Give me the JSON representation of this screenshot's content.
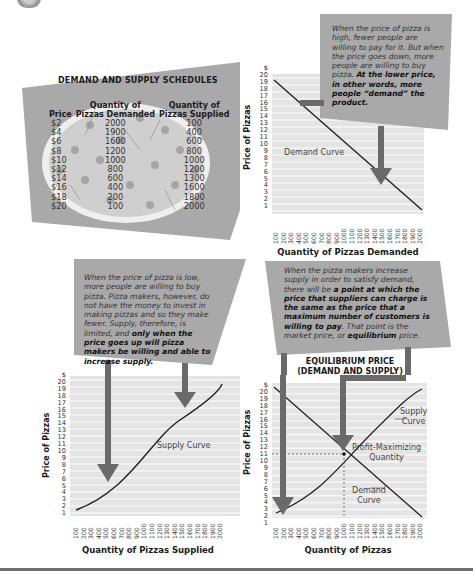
{
  "schedule": {
    "title": "DEMAND AND SUPPLY SCHEDULES",
    "headers": {
      "price": "Price",
      "demanded_line1": "Quantity of",
      "demanded_line2": "Pizzas Demanded",
      "supplied_line1": "Quantity of",
      "supplied_line2": "Pizzas Supplied"
    },
    "rows": [
      {
        "price": "$2",
        "demanded": "2000",
        "supplied": "100"
      },
      {
        "price": "$4",
        "demanded": "1900",
        "supplied": "400"
      },
      {
        "price": "$6",
        "demanded": "1600",
        "supplied": "600"
      },
      {
        "price": "$8",
        "demanded": "1200",
        "supplied": "800"
      },
      {
        "price": "$10",
        "demanded": "1000",
        "supplied": "1000"
      },
      {
        "price": "$12",
        "demanded": "800",
        "supplied": "1200"
      },
      {
        "price": "$14",
        "demanded": "600",
        "supplied": "1300"
      },
      {
        "price": "$16",
        "demanded": "400",
        "supplied": "1600"
      },
      {
        "price": "$18",
        "demanded": "200",
        "supplied": "1800"
      },
      {
        "price": "$20",
        "demanded": "100",
        "supplied": "2000"
      }
    ]
  },
  "callouts": {
    "demand": {
      "italic": "When the price of pizza is high, fewer people are willing to pay for it. But when the price goes down, more people are willing to buy pizza.",
      "bold": "At the lower price, in other words, more people “demand” the product."
    },
    "supply": {
      "italic": "When the price of pizza is low, more people are willing to buy pizza. Pizza makers, however, do not have the money to invest in making pizzas and so they make fewer. Supply, therefore, is limited, and",
      "bold": "only when the price goes up will pizza makers be willing and able to increase supply."
    },
    "equilibrium": {
      "italic1": "When the pizza makers increase supply in order to satisfy demand, there will be",
      "bold1": "a point at which the price that suppliers can charge is the same as the price that a maximum number of customers is willing to pay",
      "italic2": ". That point is the market price, or",
      "bold2": "equilibrium",
      "italic3": "price."
    }
  },
  "axes": {
    "y_unit": "$",
    "y_ticks": [
      "20",
      "19",
      "18",
      "17",
      "16",
      "15",
      "14",
      "13",
      "12",
      "11",
      "10",
      "9",
      "8",
      "7",
      "6",
      "5",
      "4",
      "3",
      "2",
      "1"
    ],
    "x_ticks": [
      "100",
      "200",
      "300",
      "400",
      "500",
      "600",
      "700",
      "800",
      "900",
      "1000",
      "1100",
      "1200",
      "1300",
      "1400",
      "1500",
      "1600",
      "1700",
      "1800",
      "1900",
      "2000"
    ],
    "y_label": "Price of Pizzas"
  },
  "charts": {
    "demand": {
      "curve_label": "Demand Curve",
      "x_label": "Quantity of Pizzas Demanded"
    },
    "supply": {
      "curve_label": "Supply Curve",
      "x_label": "Quantity of Pizzas Supplied"
    },
    "equilibrium": {
      "title_line1": "EQUILIBRIUM PRICE",
      "title_line2": "(DEMAND AND SUPPLY)",
      "supply_label_1": "Supply",
      "supply_label_2": "Curve",
      "point_label_1": "Profit-Maximizing",
      "point_label_2": "Quantity",
      "demand_label_1": "Demand",
      "demand_label_2": "Curve",
      "x_label": "Quantity of Pizzas"
    }
  },
  "colors": {
    "panel_gray": "#a9a9a9",
    "grid_bg": "#e4e4e4",
    "grid_line": "#f4f4f4",
    "arrow": "#6a6a6a",
    "curve": "#222222"
  },
  "chart_data": [
    {
      "type": "table",
      "title": "DEMAND AND SUPPLY SCHEDULES",
      "columns": [
        "Price",
        "Quantity of Pizzas Demanded",
        "Quantity of Pizzas Supplied"
      ],
      "rows": [
        [
          2,
          2000,
          100
        ],
        [
          4,
          1900,
          400
        ],
        [
          6,
          1600,
          600
        ],
        [
          8,
          1200,
          800
        ],
        [
          10,
          1000,
          1000
        ],
        [
          12,
          800,
          1200
        ],
        [
          14,
          600,
          1300
        ],
        [
          16,
          400,
          1600
        ],
        [
          18,
          200,
          1800
        ],
        [
          20,
          100,
          2000
        ]
      ]
    },
    {
      "type": "line",
      "title": "Demand Curve",
      "xlabel": "Quantity of Pizzas Demanded",
      "ylabel": "Price of Pizzas",
      "x": [
        100,
        200,
        400,
        600,
        800,
        1000,
        1200,
        1600,
        1900,
        2000
      ],
      "series": [
        {
          "name": "Demand Curve",
          "values": [
            20,
            18,
            16,
            14,
            12,
            10,
            8,
            6,
            4,
            2
          ]
        }
      ],
      "xlim": [
        100,
        2000
      ],
      "ylim": [
        1,
        20
      ],
      "grid": true
    },
    {
      "type": "line",
      "title": "Supply Curve",
      "xlabel": "Quantity of Pizzas Supplied",
      "ylabel": "Price of Pizzas",
      "x": [
        100,
        400,
        600,
        800,
        1000,
        1200,
        1300,
        1600,
        1800,
        2000
      ],
      "series": [
        {
          "name": "Supply Curve",
          "values": [
            2,
            4,
            6,
            8,
            10,
            12,
            14,
            16,
            18,
            20
          ]
        }
      ],
      "xlim": [
        100,
        2000
      ],
      "ylim": [
        1,
        20
      ],
      "grid": true
    },
    {
      "type": "line",
      "title": "EQUILIBRIUM PRICE (DEMAND AND SUPPLY)",
      "xlabel": "Quantity of Pizzas",
      "ylabel": "Price of Pizzas",
      "series": [
        {
          "name": "Supply Curve",
          "x": [
            100,
            400,
            600,
            800,
            1000,
            1200,
            1300,
            1600,
            1800,
            2000
          ],
          "values": [
            2,
            4,
            6,
            8,
            10,
            12,
            14,
            16,
            18,
            20
          ]
        },
        {
          "name": "Demand Curve",
          "x": [
            100,
            200,
            400,
            600,
            800,
            1000,
            1200,
            1600,
            1900,
            2000
          ],
          "values": [
            20,
            18,
            16,
            14,
            12,
            10,
            8,
            6,
            4,
            2
          ]
        }
      ],
      "annotations": [
        {
          "text": "Profit-Maximizing Quantity",
          "x": 1000,
          "y": 10
        }
      ],
      "xlim": [
        100,
        2000
      ],
      "ylim": [
        1,
        20
      ],
      "grid": true
    }
  ]
}
